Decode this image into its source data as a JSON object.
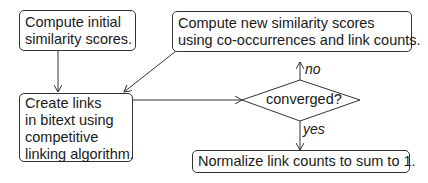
{
  "nodes": {
    "initial": {
      "lines": [
        "Compute initial",
        "similarity scores."
      ]
    },
    "compute_new": {
      "lines": [
        "Compute new similarity scores",
        "using co-occurrences and link counts."
      ]
    },
    "create_links": {
      "lines": [
        "Create links",
        "in bitext using",
        "competitive",
        "linking algorithm."
      ]
    },
    "decision": {
      "text": "converged?"
    },
    "normalize": {
      "lines": [
        "Normalize link counts to sum to 1."
      ]
    }
  },
  "edges": {
    "no_label": "no",
    "yes_label": "yes"
  }
}
